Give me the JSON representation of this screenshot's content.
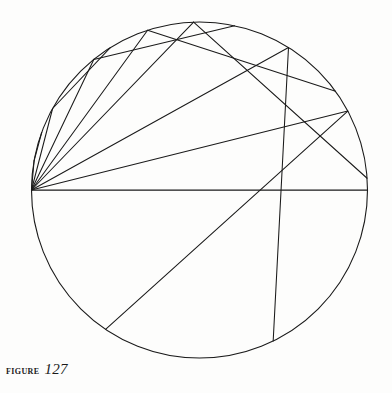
{
  "figure": {
    "caption_label": "Figure",
    "caption_number": "127",
    "background_color": "#fdfdfc",
    "ink_color": "#1a1a1a"
  },
  "chart_data": {
    "type": "diagram",
    "xlabel": "",
    "ylabel": "",
    "xlim": [
      0,
      392
    ],
    "ylim": [
      0,
      393
    ],
    "grid": false,
    "legend": "none",
    "coordinate_note": "pixel coordinates, y increases downward",
    "circle": {
      "name": "mirror-circle",
      "center_x": 199.5,
      "center_y": 190,
      "radius": 168,
      "stroke": "#1a1a1a",
      "stroke_width": 1.1
    },
    "source_point": {
      "name": "light-source",
      "x": 31.5,
      "y": 190,
      "description": "luminous point on the circumference, left end of horizontal diameter"
    },
    "horizontal_diameter": {
      "name": "axis-diameter",
      "x1": 31.5,
      "y1": 190,
      "x2": 367.5,
      "y2": 190
    },
    "incident_rays": [
      {
        "id": 1,
        "hit_angle_deg": 170,
        "hit_x": 34.1,
        "hit_y": 160.8
      },
      {
        "id": 2,
        "hit_angle_deg": 151,
        "hit_x": 52.6,
        "hit_y": 108.5
      },
      {
        "id": 3,
        "hit_angle_deg": 129,
        "hit_x": 93.8,
        "hit_y": 59.4
      },
      {
        "id": 4,
        "hit_angle_deg": 108,
        "hit_x": 147.6,
        "hit_y": 30.2
      },
      {
        "id": 5,
        "hit_angle_deg": 92,
        "hit_x": 193.6,
        "hit_y": 22.1
      },
      {
        "id": 6,
        "hit_angle_deg": 58,
        "hit_x": 288.5,
        "hit_y": 47.5
      },
      {
        "id": 7,
        "hit_angle_deg": 28,
        "hit_x": 347.8,
        "hit_y": 111.1
      }
    ],
    "reflected_rays_note": "each incident ray reflects at the circle and travels to a second point on the circle; envelope of the reflected family is a cardioid-like caustic with cusp near the focal point",
    "focus_region": {
      "x": 296,
      "y": 191,
      "description": "rays crowd near this point on the axis"
    },
    "caustic": {
      "name": "caustic-envelope",
      "type": "cardioid-cusp",
      "cusp_x": 296,
      "cusp_y": 191,
      "description": "bright curve traced by the dense crossings of reflected rays in the lower-right of the disc"
    }
  }
}
